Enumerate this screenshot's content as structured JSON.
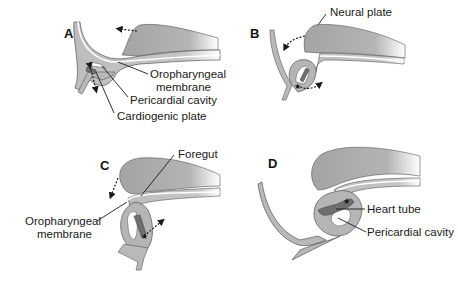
{
  "diagram": {
    "panels": [
      {
        "id": "A",
        "letter": "A",
        "labels": {
          "oropharyngeal_line1": "Oropharyngeal",
          "oropharyngeal_line2": "membrane",
          "pericardial": "Pericardial cavity",
          "cardiogenic": "Cardiogenic plate"
        }
      },
      {
        "id": "B",
        "letter": "B",
        "labels": {
          "neural": "Neural plate"
        }
      },
      {
        "id": "C",
        "letter": "C",
        "labels": {
          "foregut": "Foregut",
          "oropharyngeal_line1": "Oropharyngeal",
          "oropharyngeal_line2": "membrane"
        }
      },
      {
        "id": "D",
        "letter": "D",
        "labels": {
          "heart_tube": "Heart tube",
          "pericardial": "Pericardial cavity"
        }
      }
    ],
    "colors": {
      "tissue_dark": "#a9a9a9",
      "tissue_light": "#b7b7b7",
      "heart": "#6f6f6f",
      "outline": "#555555",
      "text": "#1a1a1a"
    }
  }
}
